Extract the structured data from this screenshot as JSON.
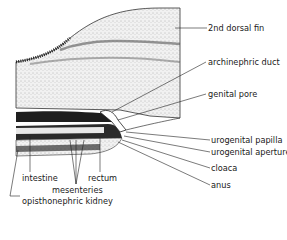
{
  "figure": {
    "labels_right": [
      {
        "id": "2nd-dorsal-fin",
        "text": "2nd dorsal fin"
      },
      {
        "id": "archinephric-duct",
        "text": "archinephric duct"
      },
      {
        "id": "genital-pore",
        "text": "genital pore"
      },
      {
        "id": "urogenital-papilla",
        "text": "urogenital papilla"
      },
      {
        "id": "urogenital-aperture",
        "text": "urogenital aperture"
      },
      {
        "id": "cloaca",
        "text": "cloaca"
      },
      {
        "id": "anus",
        "text": "anus"
      }
    ],
    "labels_bottom": [
      {
        "id": "intestine",
        "text": "intestine"
      },
      {
        "id": "rectum",
        "text": "rectum"
      },
      {
        "id": "mesenteries",
        "text": "mesenteries"
      },
      {
        "id": "opisthonephric-kidney",
        "text": "opisthonephric kidney"
      }
    ],
    "colors": {
      "ink": "#1a1a1a",
      "stipple": "#d9d9d9",
      "dark": "#222222",
      "paper": "#ffffff"
    }
  }
}
